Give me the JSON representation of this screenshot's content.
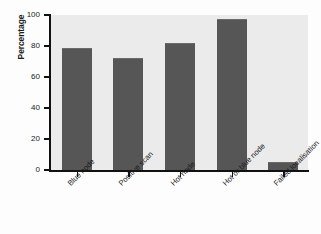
{
  "chart_data": {
    "type": "bar",
    "title": "",
    "subtitle": "",
    "xlabel": "",
    "ylabel": "Percentage",
    "categories": [
      "Blue node",
      "Positive scan",
      "Hot node",
      "Hot or blue node",
      "Failed localisation"
    ],
    "values": [
      79,
      72,
      82,
      97.5,
      5
    ],
    "ylim": [
      0,
      100
    ],
    "yticks": [
      0,
      20,
      40,
      60,
      80,
      100
    ],
    "ytick_labels": [
      "0",
      "20",
      "40",
      "60",
      "80",
      "100"
    ],
    "grid": false,
    "legend": null,
    "legend_position": "none",
    "series": [
      {
        "name": "Percentage",
        "values": [
          79,
          72,
          82,
          97.5,
          5
        ]
      }
    ],
    "annotations": []
  },
  "style": {
    "bar_color": "#565656",
    "plot_background": "#ebebeb",
    "figure_background": "#fdfdfd",
    "axis_color": "#111111",
    "text_color": "#1a1a1a"
  }
}
